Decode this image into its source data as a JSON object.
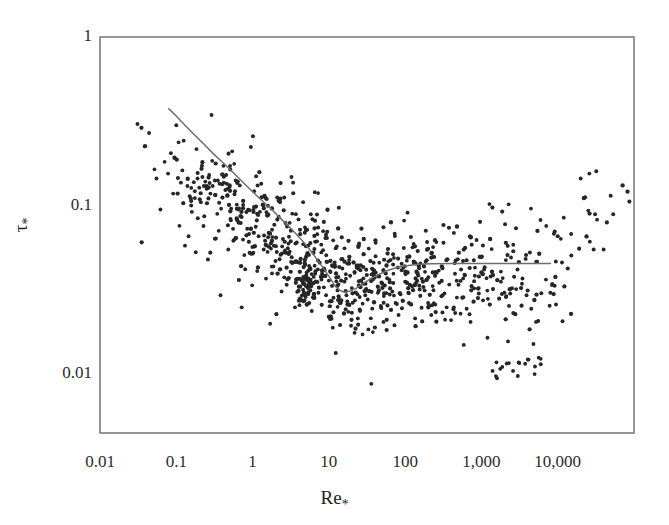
{
  "chart_data": {
    "type": "scatter",
    "title": "",
    "xlabel": "Re*",
    "ylabel": "t*",
    "xscale": "log",
    "yscale": "log",
    "xlim": [
      0.01,
      100000
    ],
    "ylim": [
      0.0045,
      1
    ],
    "grid": false,
    "legend": null,
    "xticklabels": [
      "0.01",
      "0.1",
      "1",
      "10",
      "100",
      "1,000",
      "10,000"
    ],
    "xtickvalues": [
      0.01,
      0.1,
      1,
      10,
      100,
      1000,
      10000
    ],
    "yticklabels": [
      "1",
      "0.1",
      "0.01"
    ],
    "ytickvalues": [
      1,
      0.1,
      0.01
    ],
    "series": [
      {
        "name": "Shields curve",
        "type": "line",
        "points": [
          [
            0.08,
            0.375
          ],
          [
            0.1,
            0.34
          ],
          [
            0.13,
            0.3
          ],
          [
            0.17,
            0.265
          ],
          [
            0.23,
            0.232
          ],
          [
            0.3,
            0.205
          ],
          [
            0.42,
            0.178
          ],
          [
            0.6,
            0.152
          ],
          [
            0.85,
            0.13
          ],
          [
            1.2,
            0.112
          ],
          [
            1.7,
            0.097
          ],
          [
            2.4,
            0.083
          ],
          [
            3.3,
            0.072
          ],
          [
            4.5,
            0.062
          ],
          [
            6.0,
            0.053
          ],
          [
            7.5,
            0.046
          ],
          [
            9.0,
            0.041
          ],
          [
            10.5,
            0.037
          ],
          [
            12.0,
            0.0335
          ],
          [
            14.0,
            0.0315
          ],
          [
            16.0,
            0.0307
          ],
          [
            19.0,
            0.0312
          ],
          [
            23.0,
            0.0325
          ],
          [
            28.0,
            0.0345
          ],
          [
            35.0,
            0.0368
          ],
          [
            45.0,
            0.0392
          ],
          [
            60.0,
            0.0415
          ],
          [
            80.0,
            0.0432
          ],
          [
            110.0,
            0.0443
          ],
          [
            150.0,
            0.045
          ],
          [
            220.0,
            0.0453
          ],
          [
            400.0,
            0.0455
          ],
          [
            1000.0,
            0.0455
          ],
          [
            3000.0,
            0.0455
          ],
          [
            8000.0,
            0.0455
          ]
        ]
      },
      {
        "name": "Experimental data",
        "type": "scatter",
        "marker": "dot",
        "n_points": 560,
        "points": [
          [
            0.031,
            0.305
          ],
          [
            0.044,
            0.27
          ],
          [
            0.055,
            0.145
          ],
          [
            0.062,
            0.095
          ],
          [
            0.078,
            0.155
          ],
          [
            0.085,
            0.205
          ],
          [
            0.091,
            0.118
          ],
          [
            0.1,
            0.3
          ],
          [
            0.11,
            0.076
          ],
          [
            0.115,
            0.137
          ],
          [
            0.12,
            0.162
          ],
          [
            0.125,
            0.243
          ],
          [
            0.13,
            0.058
          ],
          [
            0.14,
            0.131
          ],
          [
            0.145,
            0.066
          ],
          [
            0.15,
            0.114
          ],
          [
            0.16,
            0.092
          ],
          [
            0.17,
            0.138
          ],
          [
            0.175,
            0.122
          ],
          [
            0.18,
            0.053
          ],
          [
            0.19,
            0.145
          ],
          [
            0.2,
            0.128
          ],
          [
            0.21,
            0.105
          ],
          [
            0.22,
            0.148
          ],
          [
            0.23,
            0.131
          ],
          [
            0.24,
            0.139
          ],
          [
            0.25,
            0.126
          ],
          [
            0.26,
            0.048
          ],
          [
            0.27,
            0.152
          ],
          [
            0.28,
            0.118
          ],
          [
            0.29,
            0.345
          ],
          [
            0.3,
            0.131
          ],
          [
            0.32,
            0.141
          ],
          [
            0.33,
            0.064
          ],
          [
            0.35,
            0.141
          ],
          [
            0.36,
            0.071
          ],
          [
            0.37,
            0.135
          ],
          [
            0.38,
            0.0295
          ],
          [
            0.4,
            0.134
          ],
          [
            0.42,
            0.137
          ],
          [
            0.44,
            0.124
          ],
          [
            0.45,
            0.152
          ],
          [
            0.46,
            0.135
          ],
          [
            0.48,
            0.055
          ],
          [
            0.5,
            0.129
          ],
          [
            0.52,
            0.082
          ],
          [
            0.54,
            0.21
          ],
          [
            0.56,
            0.062
          ],
          [
            0.58,
            0.117
          ],
          [
            0.6,
            0.141
          ],
          [
            0.62,
            0.096
          ],
          [
            0.65,
            0.095
          ],
          [
            0.68,
            0.132
          ],
          [
            0.7,
            0.079
          ],
          [
            0.72,
            0.025
          ],
          [
            0.75,
            0.063
          ],
          [
            0.78,
            0.051
          ],
          [
            0.8,
            0.042
          ],
          [
            0.85,
            0.073
          ],
          [
            0.9,
            0.068
          ],
          [
            0.95,
            0.223
          ],
          [
            1.0,
            0.052
          ],
          [
            1.05,
            0.122
          ],
          [
            1.1,
            0.075
          ],
          [
            1.15,
            0.041
          ],
          [
            1.2,
            0.066
          ],
          [
            1.25,
            0.092
          ],
          [
            1.3,
            0.135
          ],
          [
            1.4,
            0.055
          ],
          [
            1.5,
            0.037
          ],
          [
            1.6,
            0.065
          ],
          [
            1.7,
            0.02
          ],
          [
            1.8,
            0.072
          ],
          [
            1.9,
            0.058
          ],
          [
            2.0,
            0.047
          ],
          [
            2.1,
            0.112
          ],
          [
            2.2,
            0.086
          ],
          [
            2.3,
            0.042
          ],
          [
            2.4,
            0.031
          ],
          [
            2.5,
            0.0635
          ],
          [
            2.6,
            0.112
          ],
          [
            2.7,
            0.079
          ],
          [
            2.8,
            0.034
          ],
          [
            2.9,
            0.056
          ],
          [
            3.0,
            0.0655
          ],
          [
            3.2,
            0.0465
          ],
          [
            3.4,
            0.137
          ],
          [
            3.6,
            0.025
          ],
          [
            3.8,
            0.0605
          ],
          [
            4.0,
            0.083
          ],
          [
            4.2,
            0.046
          ],
          [
            4.4,
            0.036
          ],
          [
            4.6,
            0.105
          ],
          [
            4.8,
            0.0275
          ],
          [
            5.0,
            0.0575
          ],
          [
            5.2,
            0.072
          ],
          [
            5.5,
            0.044
          ],
          [
            5.8,
            0.089
          ],
          [
            6.0,
            0.0345
          ],
          [
            6.3,
            0.0525
          ],
          [
            6.6,
            0.0395
          ],
          [
            7.0,
            0.0615
          ],
          [
            7.3,
            0.0305
          ],
          [
            7.6,
            0.046
          ],
          [
            8.0,
            0.0365
          ],
          [
            8.4,
            0.0545
          ],
          [
            8.8,
            0.0415
          ],
          [
            9.2,
            0.0295
          ],
          [
            9.6,
            0.0465
          ],
          [
            10.0,
            0.036
          ],
          [
            10.5,
            0.0405
          ],
          [
            11.0,
            0.0335
          ],
          [
            11.5,
            0.0285
          ],
          [
            12.0,
            0.0445
          ],
          [
            12.5,
            0.0375
          ],
          [
            13.0,
            0.0315
          ],
          [
            14.0,
            0.0265
          ],
          [
            15.0,
            0.0425
          ],
          [
            16.0,
            0.0355
          ],
          [
            17.0,
            0.0295
          ],
          [
            18.0,
            0.0235
          ],
          [
            19.0,
            0.0385
          ],
          [
            20.0,
            0.0325
          ],
          [
            22.0,
            0.0275
          ],
          [
            24.0,
            0.0215
          ],
          [
            26.0,
            0.0415
          ],
          [
            28.0,
            0.0345
          ],
          [
            30.0,
            0.0295
          ],
          [
            33.0,
            0.0185
          ],
          [
            36.0,
            0.0088
          ],
          [
            40.0,
            0.0375
          ],
          [
            44.0,
            0.0305
          ],
          [
            48.0,
            0.0255
          ],
          [
            52.0,
            0.0205
          ],
          [
            57.0,
            0.0445
          ],
          [
            62.0,
            0.0365
          ],
          [
            68.0,
            0.031
          ],
          [
            75.0,
            0.0265
          ],
          [
            82.0,
            0.0225
          ],
          [
            90.0,
            0.0415
          ],
          [
            100.0,
            0.0355
          ],
          [
            110.0,
            0.0305
          ],
          [
            120.0,
            0.026
          ],
          [
            135.0,
            0.0215
          ],
          [
            150.0,
            0.044
          ],
          [
            165.0,
            0.037
          ],
          [
            180.0,
            0.0315
          ],
          [
            200.0,
            0.0265
          ],
          [
            220.0,
            0.0225
          ],
          [
            250.0,
            0.0405
          ],
          [
            280.0,
            0.035
          ],
          [
            310.0,
            0.0295
          ],
          [
            350.0,
            0.025
          ],
          [
            400.0,
            0.021
          ],
          [
            450.0,
            0.0395
          ],
          [
            500.0,
            0.034
          ],
          [
            560.0,
            0.0285
          ],
          [
            640.0,
            0.0245
          ],
          [
            720.0,
            0.0205
          ],
          [
            820.0,
            0.0385
          ],
          [
            920.0,
            0.0325
          ],
          [
            1050.0,
            0.0275
          ],
          [
            1200.0,
            0.0165
          ],
          [
            1400.0,
            0.0105
          ],
          [
            1600.0,
            0.0095
          ],
          [
            1800.0,
            0.0355
          ],
          [
            2000.0,
            0.0305
          ],
          [
            2300.0,
            0.0255
          ],
          [
            2600.0,
            0.0105
          ],
          [
            3000.0,
            0.0098
          ],
          [
            3400.0,
            0.0345
          ],
          [
            3900.0,
            0.0295
          ],
          [
            4500.0,
            0.0245
          ],
          [
            5200.0,
            0.0205
          ],
          [
            6000.0,
            0.0115
          ],
          [
            7000.0,
            0.0365
          ],
          [
            8000.0,
            0.0305
          ],
          [
            9500.0,
            0.026
          ],
          [
            12000.0,
            0.085
          ],
          [
            15000.0,
            0.068
          ],
          [
            20000.0,
            0.145
          ],
          [
            26000.0,
            0.155
          ],
          [
            32000.0,
            0.16
          ],
          [
            40000.0,
            0.055
          ]
        ]
      }
    ]
  },
  "axes": {
    "y_title": "τ",
    "y_title_sub": "*",
    "x_title": "Re",
    "x_title_sub": "*",
    "x_ticks": [
      {
        "label": "0.01",
        "value": 0.01
      },
      {
        "label": "0.1",
        "value": 0.1
      },
      {
        "label": "1",
        "value": 1
      },
      {
        "label": "10",
        "value": 10
      },
      {
        "label": "100",
        "value": 100
      },
      {
        "label": "1,000",
        "value": 1000
      },
      {
        "label": "10,000",
        "value": 10000
      }
    ],
    "y_ticks": [
      {
        "label": "1",
        "value": 1
      },
      {
        "label": "0.1",
        "value": 0.1
      },
      {
        "label": "0.01",
        "value": 0.01
      }
    ]
  },
  "colors": {
    "frame": "#7d7d7d",
    "curve": "#6e6e6e",
    "point": "#262626",
    "text": "#2b2b2b",
    "background": "#ffffff"
  }
}
